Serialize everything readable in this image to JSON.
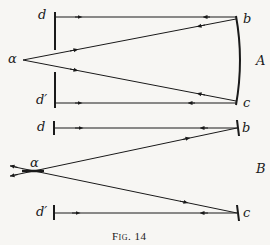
{
  "figure": {
    "caption": "Fig. 14",
    "parts": {
      "A": {
        "label": "A",
        "point_left": "α",
        "screen_top": "d",
        "screen_bottom": "d′",
        "mirror_top": "b",
        "mirror_bottom": "c"
      },
      "B": {
        "label": "B",
        "point_left": "α",
        "screen_top": "d",
        "screen_bottom": "d′",
        "mirror_top": "b",
        "mirror_bottom": "c"
      }
    },
    "ink_color": "#1a1a1a",
    "paper_color": "#f7f6f3"
  }
}
